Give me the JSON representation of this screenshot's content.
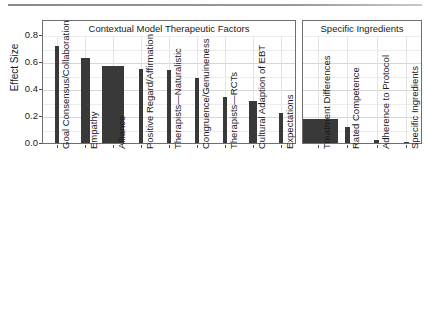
{
  "figure": {
    "y_axis_title": "Effect Size",
    "y_ticks": [
      "0.0",
      "0.2",
      "0.4",
      "0.6",
      "0.8"
    ],
    "panel_titles": {
      "left": "Contextual Model Therapeutic Factors",
      "right": "Specific Ingredients"
    }
  },
  "chart_data": {
    "type": "bar",
    "title": "",
    "xlabel": "",
    "ylabel": "Effect Size",
    "ylim": [
      0.0,
      0.8
    ],
    "y_ticks": [
      0.0,
      0.2,
      0.4,
      0.6,
      0.8
    ],
    "grid": true,
    "legend": "none",
    "bar_color": "#393939",
    "panels": [
      {
        "name": "Contextual Model Therapeutic Factors",
        "categories": [
          "Goal Consensus/Collaboration",
          "Empathy",
          "Alliance",
          "Positive Regard/Affirmation",
          "Therapists—Naturalistic",
          "Congruence/Genuineness",
          "Therapists—RCTs",
          "Cultural Adaption of EBT",
          "Expectations"
        ],
        "values": [
          0.72,
          0.63,
          0.57,
          0.55,
          0.54,
          0.48,
          0.34,
          0.31,
          0.22
        ],
        "bar_widths": [
          4,
          9,
          22,
          4,
          4,
          4,
          4,
          8,
          4,
          12
        ]
      },
      {
        "name": "Specific Ingredients",
        "categories": [
          "Treatment Differences",
          "Rated Competence",
          "Adherence to Protocol",
          "Specific Ingredients"
        ],
        "values": [
          0.18,
          0.12,
          0.02,
          0.01
        ],
        "bar_widths": [
          40,
          5,
          5,
          5
        ]
      }
    ]
  }
}
